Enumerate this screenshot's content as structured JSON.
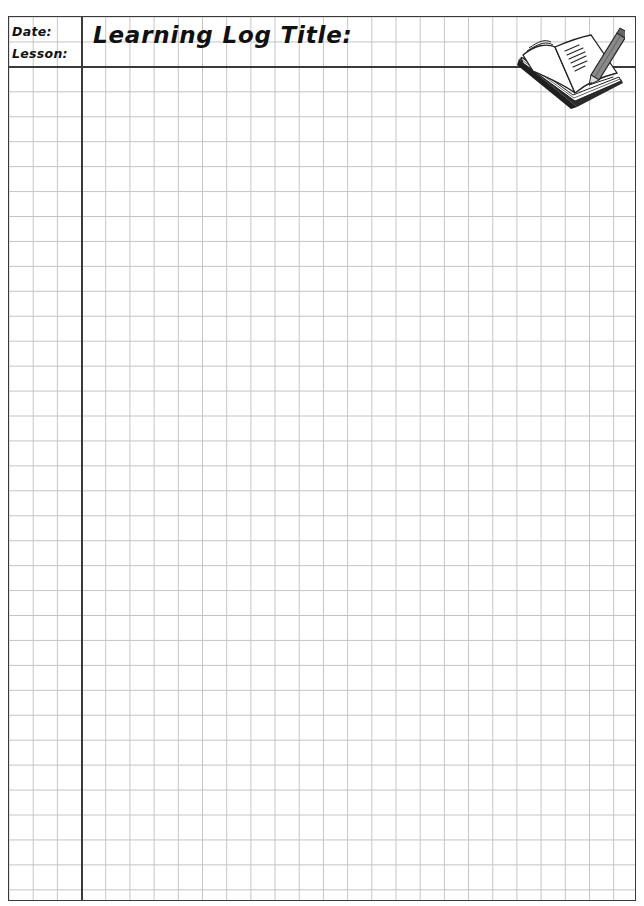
{
  "header": {
    "date_label": "Date:",
    "lesson_label": "Lesson:",
    "title_label": "Learning Log Title:",
    "date_value": "",
    "lesson_value": "",
    "title_value": ""
  },
  "icons": {
    "book": "open-book-with-pencil-icon"
  },
  "grid": {
    "line_color": "#c4c4c4",
    "border_color": "#3a3a3a",
    "cell_width_px": 24.2,
    "cell_height_px": 24.95
  },
  "body": {
    "writing_area_content": ""
  }
}
